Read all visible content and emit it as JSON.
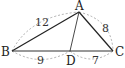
{
  "diagram": {
    "points": {
      "A": {
        "label": "A",
        "x": 79,
        "y": 12
      },
      "B": {
        "label": "B",
        "x": 12,
        "y": 51
      },
      "C": {
        "label": "C",
        "x": 113,
        "y": 51
      },
      "D": {
        "label": "D",
        "x": 70,
        "y": 51
      }
    },
    "lengths": {
      "AB": "12",
      "AC": "8",
      "BD": "9",
      "DC": "7"
    },
    "segments": [
      "AB",
      "AC",
      "BC",
      "AD"
    ],
    "colors": {
      "line": "#222222",
      "dashed": "#9a9a9a"
    }
  }
}
